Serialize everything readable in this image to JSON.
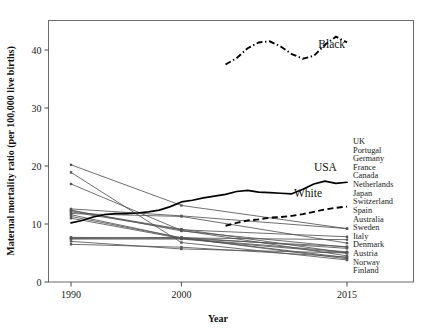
{
  "chart_data": {
    "type": "line",
    "title": "",
    "xlabel": "Year",
    "ylabel": "Maternal mortality ratio (per 100,000 live births)",
    "xlim": [
      1990,
      2015
    ],
    "ylim": [
      0,
      44.5
    ],
    "xticks": [
      1990,
      2000,
      2015
    ],
    "xticklabels": [
      "1990",
      "2000",
      "2015"
    ],
    "yticks": [
      0,
      10,
      20,
      30,
      40
    ],
    "yticklabels": [
      "0",
      "10",
      "20",
      "30",
      "40"
    ],
    "grid": false,
    "legend_position": "right-outside",
    "annotations": [
      {
        "text": "Black",
        "x": 2012.4,
        "y": 40.4
      },
      {
        "text": "USA",
        "x": 2012.0,
        "y": 19.2
      },
      {
        "text": "White",
        "x": 2010.2,
        "y": 14.6
      }
    ],
    "highlight_series": [
      {
        "name": "Black",
        "style": "dashdot",
        "x": [
          2004,
          2005,
          2006,
          2007,
          2008,
          2009,
          2010,
          2011,
          2012,
          2013,
          2014,
          2015
        ],
        "values": [
          37.5,
          38.6,
          40.3,
          41.3,
          41.5,
          40.6,
          39.3,
          38.5,
          39.0,
          40.9,
          42.3,
          41.3
        ]
      },
      {
        "name": "USA",
        "style": "solid",
        "x": [
          1990,
          1991,
          1992,
          1993,
          1994,
          1995,
          1996,
          1997,
          1998,
          1999,
          2000,
          2001,
          2002,
          2003,
          2004,
          2005,
          2006,
          2007,
          2008,
          2009,
          2010,
          2011,
          2012,
          2013,
          2014,
          2015
        ],
        "values": [
          10.2,
          10.6,
          11.2,
          11.6,
          11.8,
          11.8,
          11.9,
          12.1,
          12.4,
          13.0,
          13.8,
          14.1,
          14.5,
          14.8,
          15.1,
          15.6,
          15.8,
          15.5,
          15.4,
          15.3,
          15.2,
          16.0,
          16.9,
          17.4,
          17.0,
          17.2
        ]
      },
      {
        "name": "White",
        "style": "dashed",
        "x": [
          2004,
          2005,
          2006,
          2007,
          2008,
          2009,
          2010,
          2011,
          2012,
          2013,
          2014,
          2015
        ],
        "values": [
          9.7,
          10.2,
          10.6,
          10.8,
          11.1,
          11.2,
          11.4,
          11.7,
          12.1,
          12.5,
          12.8,
          13.0
        ]
      }
    ],
    "series": [
      {
        "name": "UK",
        "x": [
          1990,
          2000,
          2015
        ],
        "values": [
          12.6,
          11.4,
          9.2
        ]
      },
      {
        "name": "Portugal",
        "x": [
          1990,
          2000,
          2015
        ],
        "values": [
          20.2,
          13.2,
          9.2
        ]
      },
      {
        "name": "Germany",
        "x": [
          1990,
          2000,
          2015
        ],
        "values": [
          12.4,
          8.8,
          6.0
        ]
      },
      {
        "name": "France",
        "x": [
          1990,
          2000,
          2015
        ],
        "values": [
          12.1,
          9.0,
          7.8
        ]
      },
      {
        "name": "Canada",
        "x": [
          1990,
          2000,
          2015
        ],
        "values": [
          7.6,
          7.6,
          7.3
        ]
      },
      {
        "name": "Netherlands",
        "x": [
          1990,
          2000,
          2015
        ],
        "values": [
          11.8,
          11.3,
          6.7
        ]
      },
      {
        "name": "Japan",
        "x": [
          1990,
          2000,
          2015
        ],
        "values": [
          12.3,
          9.1,
          5.0
        ]
      },
      {
        "name": "Switzerland",
        "x": [
          1990,
          2000,
          2015
        ],
        "values": [
          7.7,
          7.5,
          5.2
        ]
      },
      {
        "name": "Spain",
        "x": [
          1990,
          2000,
          2015
        ],
        "values": [
          7.0,
          5.7,
          5.0
        ]
      },
      {
        "name": "Australia",
        "x": [
          1990,
          2000,
          2015
        ],
        "values": [
          7.5,
          7.7,
          5.8
        ]
      },
      {
        "name": "Sweden",
        "x": [
          1990,
          2000,
          2015
        ],
        "values": [
          6.5,
          6.0,
          4.3
        ]
      },
      {
        "name": "Italy",
        "x": [
          1990,
          2000,
          2015
        ],
        "values": [
          11.6,
          7.6,
          4.2
        ]
      },
      {
        "name": "Denmark",
        "x": [
          1990,
          2000,
          2015
        ],
        "values": [
          11.0,
          7.5,
          6.1
        ]
      },
      {
        "name": "Austria",
        "x": [
          1990,
          2000,
          2015
        ],
        "values": [
          11.3,
          7.6,
          4.0
        ]
      },
      {
        "name": "Norway",
        "x": [
          1990,
          2000,
          2015
        ],
        "values": [
          7.4,
          7.4,
          5.0
        ]
      },
      {
        "name": "Finland",
        "x": [
          1990,
          2000,
          2015
        ],
        "values": [
          18.9,
          6.8,
          3.8
        ]
      },
      {
        "name": "extra-high-1",
        "x": [
          1990,
          2000,
          2015
        ],
        "values": [
          16.9,
          8.9,
          4.5
        ]
      }
    ],
    "legend_entries": [
      "UK",
      "Portugal",
      "Germany",
      "France",
      "Canada",
      "Netherlands",
      "Japan",
      "Switzerland",
      "Spain",
      "Australia",
      "Sweden",
      "Italy",
      "Denmark",
      "Austria",
      "Norway",
      "Finland"
    ],
    "colors": {
      "country_line": "#555555",
      "highlight_line": "#000000",
      "frame": "#6b6b6b",
      "background": "#ffffff"
    }
  }
}
